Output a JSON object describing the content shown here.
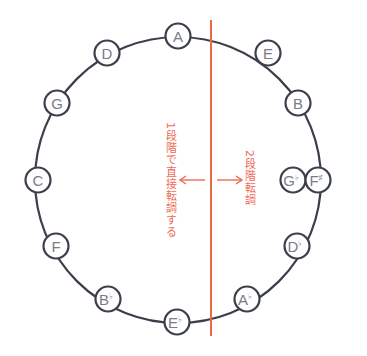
{
  "diagram": {
    "colors": {
      "ring": "#3b3f4a",
      "divider": "#ea6a48",
      "label_text": "#ee6a55",
      "node_text": "#7a7d85"
    },
    "nodes": [
      {
        "id": "A",
        "base": "A",
        "acc": "",
        "x": 178,
        "y": 36
      },
      {
        "id": "E",
        "base": "E",
        "acc": "",
        "x": 268,
        "y": 53
      },
      {
        "id": "B",
        "base": "B",
        "acc": "",
        "x": 298,
        "y": 103
      },
      {
        "id": "Gb",
        "base": "G",
        "acc": "♭",
        "x": 293,
        "y": 180
      },
      {
        "id": "Fs",
        "base": "F",
        "acc": "♯",
        "x": 318,
        "y": 180
      },
      {
        "id": "Db",
        "base": "D",
        "acc": "♭",
        "x": 297,
        "y": 246
      },
      {
        "id": "Ab",
        "base": "A",
        "acc": "♭",
        "x": 247,
        "y": 299
      },
      {
        "id": "Eb",
        "base": "E",
        "acc": "♭",
        "x": 177,
        "y": 322
      },
      {
        "id": "Bb",
        "base": "B",
        "acc": "♭",
        "x": 108,
        "y": 299
      },
      {
        "id": "F",
        "base": "F",
        "acc": "",
        "x": 56,
        "y": 246
      },
      {
        "id": "C",
        "base": "C",
        "acc": "",
        "x": 38,
        "y": 180
      },
      {
        "id": "G",
        "base": "G",
        "acc": "",
        "x": 57,
        "y": 103
      },
      {
        "id": "D",
        "base": "D",
        "acc": "",
        "x": 107,
        "y": 53
      }
    ],
    "left_label": "1段階で直接転調する",
    "right_label": "2段階転調",
    "left_arrow": "←",
    "right_arrow": "→"
  }
}
